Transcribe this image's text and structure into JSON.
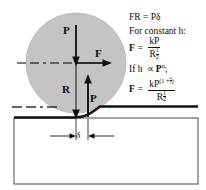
{
  "figure": {
    "colors": {
      "sphere_fill": "#c4c4c4",
      "sphere_stroke": "#b0b0b0",
      "line": "#111111",
      "substrate_outline": "#3a3a3a",
      "background": "#ffffff"
    }
  },
  "diagram": {
    "sphere_label": "indenter-sphere",
    "load_down_label": "P",
    "friction_label": "F",
    "radius_label": "R",
    "reaction_label": "P",
    "penetration_label": "δ",
    "centerline_label": "horizontal-centerline",
    "surface_label": "original-surface-datum"
  },
  "equations": {
    "line1": "FR  =  Pδ",
    "line2": "For constant h:",
    "eq1": {
      "lhs": "F",
      "eq": "=",
      "numerator": "kP",
      "denominator": "R",
      "denominator_exp_num": "1",
      "denominator_exp_den": "2"
    },
    "line3_prefix": "If h",
    "line3_prop": "∝",
    "line3_base": "P",
    "line3_exp": "n",
    "line3_suffix": ";",
    "eq2": {
      "lhs": "F",
      "eq": "=",
      "num_base": "kP",
      "num_exp_open": "(1 +",
      "num_exp_frac_num": "n",
      "num_exp_frac_den": "2",
      "num_exp_close": ")",
      "denominator": "R",
      "denominator_exp_num": "1",
      "denominator_exp_den": "2"
    }
  }
}
